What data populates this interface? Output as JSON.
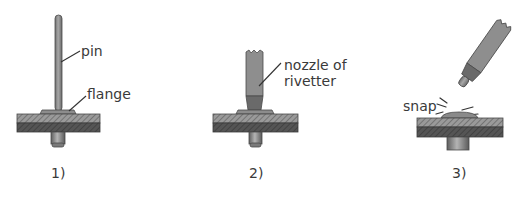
{
  "diagram": {
    "type": "process-steps",
    "colors": {
      "metal_light": "#9a9a9a",
      "metal_mid": "#7e7e7e",
      "metal_dark": "#5a5a5a",
      "plate_top": "#8a8a8a",
      "plate_bottom": "#4e4e4e",
      "outline": "#3a3a3a",
      "text": "#3a3a3a"
    },
    "panels": [
      {
        "step_label": "1)",
        "labels": {
          "pin": "pin",
          "flange": "flange"
        }
      },
      {
        "step_label": "2)",
        "labels": {
          "nozzle_line1": "nozzle of",
          "nozzle_line2": "rivetter"
        }
      },
      {
        "step_label": "3)",
        "labels": {
          "snap": "snap"
        }
      }
    ]
  }
}
